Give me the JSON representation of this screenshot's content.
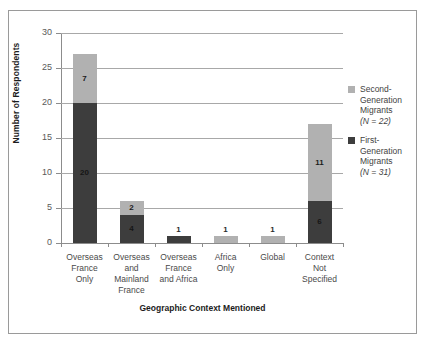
{
  "figure": {
    "background": "#ffffff",
    "frame_color": "#9a9a9a"
  },
  "chart_data": {
    "type": "bar",
    "subtype": "stacked-bar",
    "title": "",
    "xlabel": "Geographic Context Mentioned",
    "ylabel": "Number of Respondents",
    "ylim": [
      0,
      30
    ],
    "yticks": [
      0,
      5,
      10,
      15,
      20,
      25,
      30
    ],
    "grid": "horizontal",
    "legend_position": "right",
    "categories": [
      "Overseas France Only",
      "Overseas and Mainland France",
      "Overseas France and Africa",
      "Africa Only",
      "Global",
      "Context Not Specified"
    ],
    "category_lines": [
      [
        "Overseas",
        "France",
        "Only"
      ],
      [
        "Overseas",
        "and",
        "Mainland",
        "France"
      ],
      [
        "Overseas",
        "France",
        "and Africa"
      ],
      [
        "Africa",
        "Only"
      ],
      [
        "Global"
      ],
      [
        "Context",
        "Not",
        "Specified"
      ]
    ],
    "series": [
      {
        "name": "First-Generation Migrants",
        "n": 31,
        "color": "#3d3d3d",
        "values": [
          20,
          4,
          1,
          0,
          0,
          6
        ]
      },
      {
        "name": "Second-Generation Migrants",
        "n": 22,
        "color": "#b1b1b1",
        "values": [
          7,
          2,
          0,
          1,
          1,
          11
        ]
      }
    ],
    "totals": [
      27,
      6,
      1,
      1,
      1,
      17
    ]
  },
  "axes": {
    "y": {
      "label": "Number of Respondents",
      "ticks": [
        "30",
        "25",
        "20",
        "15",
        "10",
        "5",
        "0"
      ]
    },
    "x": {
      "label": "Geographic Context Mentioned"
    }
  },
  "bars": [
    {
      "category": "Overseas France Only",
      "segments": [
        {
          "series": "second",
          "value": 7,
          "label": "7",
          "label_inside": true
        },
        {
          "series": "first",
          "value": 20,
          "label": "20",
          "label_inside": true
        }
      ]
    },
    {
      "category": "Overseas and Mainland France",
      "segments": [
        {
          "series": "second",
          "value": 2,
          "label": "2",
          "label_inside": true
        },
        {
          "series": "first",
          "value": 4,
          "label": "4",
          "label_inside": true
        }
      ]
    },
    {
      "category": "Overseas France and Africa",
      "segments": [
        {
          "series": "first",
          "value": 1,
          "label": "1",
          "label_inside": false
        }
      ]
    },
    {
      "category": "Africa Only",
      "segments": [
        {
          "series": "second",
          "value": 1,
          "label": "1",
          "label_inside": false
        }
      ]
    },
    {
      "category": "Global",
      "segments": [
        {
          "series": "second",
          "value": 1,
          "label": "1",
          "label_inside": false
        }
      ]
    },
    {
      "category": "Context Not Specified",
      "segments": [
        {
          "series": "second",
          "value": 11,
          "label": "11",
          "label_inside": true
        },
        {
          "series": "first",
          "value": 6,
          "label": "6",
          "label_inside": true
        }
      ]
    }
  ],
  "legend": {
    "entries": [
      {
        "key": "second",
        "color": "#b1b1b1",
        "lines": [
          "Second-",
          "Generation",
          "Migrants"
        ],
        "n_line": "(N = 22)"
      },
      {
        "key": "first",
        "color": "#3d3d3d",
        "lines": [
          "First-",
          "Generation",
          "Migrants"
        ],
        "n_line": "(N = 31)"
      }
    ]
  }
}
